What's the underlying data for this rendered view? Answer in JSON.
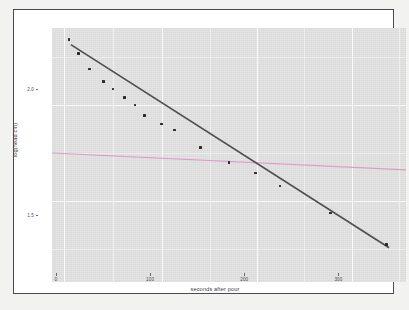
{
  "chart_data": {
    "type": "scatter",
    "title": "",
    "xlabel": "seconds after pour",
    "ylabel": "log(head cm)",
    "xlim": [
      -18,
      358
    ],
    "ylim": [
      1.27,
      2.28
    ],
    "grid": true,
    "legend": null,
    "x_ticks": [
      0,
      100,
      200,
      300
    ],
    "x_tick_labels": [
      "0",
      "100",
      "200",
      "300"
    ],
    "y_ticks": [
      1.5,
      2.0
    ],
    "y_tick_labels": [
      "1.5",
      "2.0"
    ],
    "points": [
      {
        "x": 0,
        "y": 2.235
      },
      {
        "x": 10,
        "y": 2.178
      },
      {
        "x": 22,
        "y": 2.117
      },
      {
        "x": 37,
        "y": 2.068
      },
      {
        "x": 47,
        "y": 2.038
      },
      {
        "x": 59,
        "y": 2.004
      },
      {
        "x": 70,
        "y": 1.974
      },
      {
        "x": 80,
        "y": 1.931
      },
      {
        "x": 98,
        "y": 1.898
      },
      {
        "x": 112,
        "y": 1.874
      },
      {
        "x": 140,
        "y": 1.805
      },
      {
        "x": 170,
        "y": 1.744
      },
      {
        "x": 198,
        "y": 1.704
      },
      {
        "x": 224,
        "y": 1.652
      },
      {
        "x": 278,
        "y": 1.545
      },
      {
        "x": 337,
        "y": 1.418
      }
    ],
    "series": [
      {
        "name": "fitted-regression-line",
        "type": "line",
        "color": "#4f4f4f",
        "x": [
          2,
          340
        ],
        "y": [
          2.214,
          1.406
        ]
      },
      {
        "name": "reference-line",
        "type": "line",
        "color": "#e29ac4",
        "x": [
          -18,
          358
        ],
        "y": [
          1.783,
          1.716
        ]
      }
    ],
    "panel_background": "#e0e0e0",
    "grid_color": "#fbfbfb",
    "point_color": "#2b2b2b"
  },
  "axes": {
    "x_title": "seconds after pour",
    "y_title": "log(head cm)",
    "x_labels": [
      "0",
      "100",
      "200",
      "300"
    ],
    "y_labels": [
      "2.0",
      "1.5"
    ]
  }
}
